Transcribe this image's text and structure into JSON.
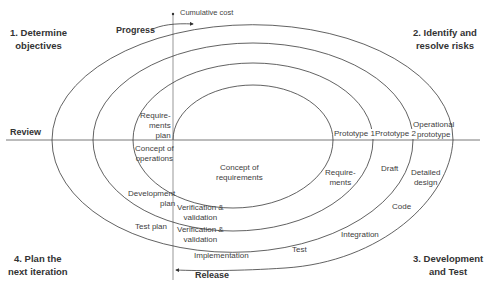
{
  "diagram": {
    "quadrants": {
      "q1": [
        "1. Determine",
        "objectives"
      ],
      "q2": [
        "2. Identify and",
        "resolve risks"
      ],
      "q3": [
        "3. Development",
        "and Test"
      ],
      "q4": [
        "4. Plan the",
        "next iteration"
      ]
    },
    "axes": {
      "vertical_label": "Cumulative cost",
      "horizontal_label": "Review",
      "progress_label": "Progress",
      "release_label": "Release"
    },
    "labels": {
      "requirements_plan": [
        "Require-",
        "ments",
        "plan"
      ],
      "concept_of_operations": [
        "Concept of",
        "operations"
      ],
      "concept_of_requirements": [
        "Concept of",
        "requirements"
      ],
      "prototype_1": "Prototype 1",
      "prototype_2": "Prototype 2",
      "operational_prototype": [
        "Operational",
        "prototype"
      ],
      "requirements": [
        "Require-",
        "ments"
      ],
      "draft": "Draft",
      "detailed_design": [
        "Detailed",
        "design"
      ],
      "development_plan": [
        "Development",
        "plan"
      ],
      "verification_validation_1": [
        "Verification &",
        "validation"
      ],
      "test_plan": "Test plan",
      "verification_validation_2": [
        "Verification &",
        "validation"
      ],
      "code": "Code",
      "integration": "Integration",
      "test": "Test",
      "implementation": "Implementation"
    },
    "colors": {
      "line": "#3a3a3a",
      "axis": "#a0a0a0",
      "text": "#404040"
    }
  }
}
